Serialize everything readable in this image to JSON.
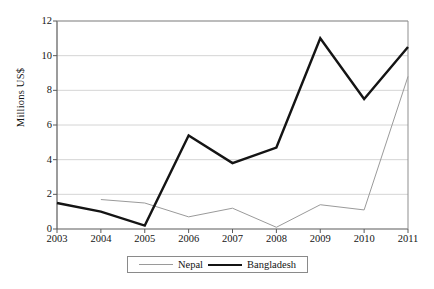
{
  "chart_data": {
    "type": "line",
    "title": "",
    "subtitle": "",
    "xlabel": "",
    "ylabel": "Millions US$",
    "x": [
      "2003",
      "2004",
      "2005",
      "2006",
      "2007",
      "2008",
      "2009",
      "2010",
      "2011"
    ],
    "categories": [
      "2003",
      "2004",
      "2005",
      "2006",
      "2007",
      "2008",
      "2009",
      "2010",
      "2011"
    ],
    "ylim": [
      0,
      12
    ],
    "yticks": [
      0,
      2,
      4,
      6,
      8,
      10,
      12
    ],
    "ytick_labels": [
      "0",
      "2",
      "4",
      "6",
      "8",
      "10",
      "12"
    ],
    "grid": "horizontal",
    "legend_position": "bottom",
    "series": [
      {
        "name": "Nepal",
        "color": "#9a9a9a",
        "line_width": 1,
        "values": [
          null,
          1.7,
          1.5,
          0.7,
          1.2,
          0.1,
          1.4,
          1.1,
          8.8
        ]
      },
      {
        "name": "Bangladesh",
        "color": "#141414",
        "line_width": 2.4,
        "values": [
          1.5,
          1.0,
          0.2,
          5.4,
          3.8,
          4.7,
          11.0,
          7.5,
          10.5
        ]
      }
    ]
  },
  "legend": {
    "items": [
      {
        "label": "Nepal",
        "color": "#9a9a9a"
      },
      {
        "label": "Bangladesh",
        "color": "#141414"
      }
    ]
  },
  "axis": {
    "y_title": "Millions US$"
  }
}
